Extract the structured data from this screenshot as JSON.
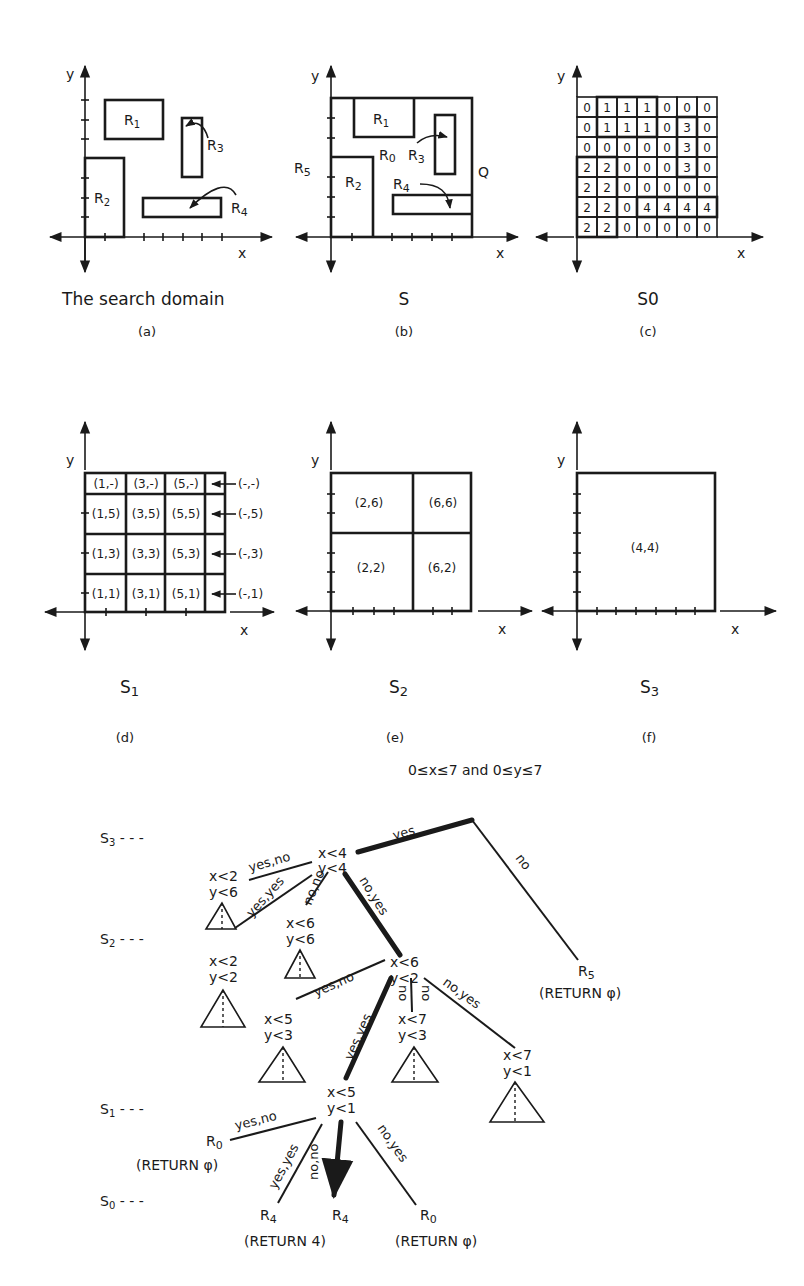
{
  "panels": {
    "a": {
      "caption": "The search domain",
      "sublabel": "(a)",
      "axis_x": "x",
      "axis_y": "y",
      "regions": [
        "R1",
        "R2",
        "R3",
        "R4"
      ]
    },
    "b": {
      "caption": "S",
      "sublabel": "(b)",
      "axis_x": "x",
      "axis_y": "y",
      "labels": {
        "r0": "R0",
        "r1": "R1",
        "r2": "R2",
        "r3": "R3",
        "r4": "R4",
        "r5": "R5",
        "q": "Q"
      }
    },
    "c": {
      "caption": "S0",
      "sublabel": "(c)",
      "axis_x": "x",
      "axis_y": "y",
      "grid": [
        [
          "0",
          "1",
          "1",
          "1",
          "0",
          "0",
          "0"
        ],
        [
          "0",
          "1",
          "1",
          "1",
          "0",
          "3",
          "0"
        ],
        [
          "0",
          "0",
          "0",
          "0",
          "0",
          "3",
          "0"
        ],
        [
          "2",
          "2",
          "0",
          "0",
          "0",
          "3",
          "0"
        ],
        [
          "2",
          "2",
          "0",
          "0",
          "0",
          "0",
          "0"
        ],
        [
          "2",
          "2",
          "0",
          "4",
          "4",
          "4",
          "4"
        ],
        [
          "2",
          "2",
          "0",
          "0",
          "0",
          "0",
          "0"
        ]
      ]
    },
    "d": {
      "caption": "S1",
      "sublabel": "(d)",
      "axis_x": "x",
      "axis_y": "y",
      "cells": [
        [
          "(1,-)",
          "(3,-)",
          "(5,-)",
          "(-,-)"
        ],
        [
          "(1,5)",
          "(3,5)",
          "(5,5)",
          "(-,5)"
        ],
        [
          "(1,3)",
          "(3,3)",
          "(5,3)",
          "(-,3)"
        ],
        [
          "(1,1)",
          "(3,1)",
          "(5,1)",
          "(-,1)"
        ]
      ]
    },
    "e": {
      "caption": "S2",
      "sublabel": "(e)",
      "axis_x": "x",
      "axis_y": "y",
      "cells": [
        "(2,6)",
        "(6,6)",
        "(2,2)",
        "(6,2)"
      ]
    },
    "f": {
      "caption": "S3",
      "sublabel": "(f)",
      "axis_x": "x",
      "axis_y": "y",
      "cells": [
        "(4,4)"
      ]
    }
  },
  "tree": {
    "domain_condition": "0≤x≤7 and 0≤y≤7",
    "levels": [
      "S3---",
      "S2---",
      "S1---",
      "S0---"
    ],
    "nodes": {
      "root": [
        "x<4",
        "y<4"
      ],
      "n26": [
        "x<2",
        "y<6"
      ],
      "n66": [
        "x<6",
        "y<6"
      ],
      "n22": [
        "x<2",
        "y<2"
      ],
      "n62": [
        "x<6",
        "y<2"
      ],
      "n53": [
        "x<5",
        "y<3"
      ],
      "n73": [
        "x<7",
        "y<3"
      ],
      "n71": [
        "x<7",
        "y<1"
      ],
      "n51": [
        "x<5",
        "y<1"
      ]
    },
    "leaves": {
      "r5": [
        "R5",
        "(RETURN φ)"
      ],
      "r0a": [
        "R0",
        "(RETURN φ)"
      ],
      "r4a": [
        "R4",
        ""
      ],
      "r4b": [
        "R4",
        "(RETURN 4)"
      ],
      "r0b": [
        "R0",
        "(RETURN φ)"
      ]
    },
    "edges": {
      "yes": "yes",
      "no": "no",
      "yes_no": "yes,no",
      "yes_yes": "yes,yes",
      "no_no": "no,no",
      "no_yes": "no,yes"
    }
  }
}
